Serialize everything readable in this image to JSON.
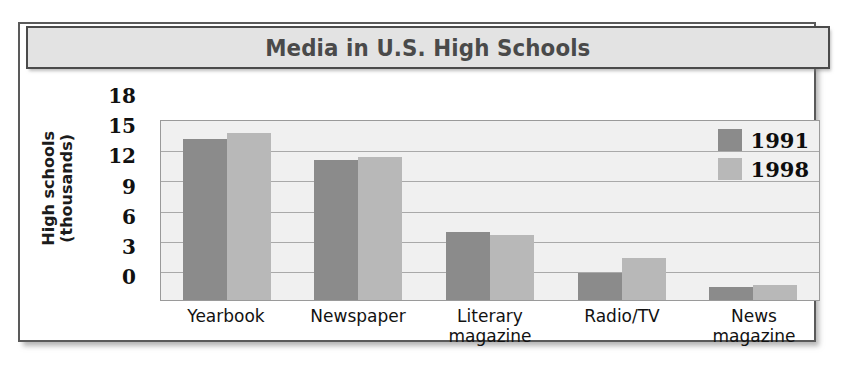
{
  "figure": {
    "title": "Media in U.S. High Schools"
  },
  "axes": {
    "y_title_line1": "High schools",
    "y_title_line2": "(thousands)",
    "y_ticks": [
      "18",
      "15",
      "12",
      "9",
      "6",
      "3",
      "0"
    ]
  },
  "legend": {
    "entries": [
      {
        "label": "1991",
        "color": "#8b8b8b"
      },
      {
        "label": "1998",
        "color": "#b8b8b8"
      }
    ]
  },
  "categories": [
    "Yearbook",
    "Newspaper",
    "Literary\nmagazine",
    "Radio/TV",
    "News\nmagazine"
  ],
  "chart_data": {
    "type": "bar",
    "title": "Media in U.S. High Schools",
    "xlabel": "",
    "ylabel": "High schools (thousands)",
    "ylim": [
      0,
      18
    ],
    "yticks": [
      0,
      3,
      6,
      9,
      12,
      15,
      18
    ],
    "grid": true,
    "legend_position": "top-right",
    "categories": [
      "Yearbook",
      "Newspaper",
      "Literary magazine",
      "Radio/TV",
      "News magazine"
    ],
    "series": [
      {
        "name": "1991",
        "color": "#8b8b8b",
        "values": [
          16.0,
          13.9,
          6.8,
          2.7,
          1.3
        ]
      },
      {
        "name": "1998",
        "color": "#b8b8b8",
        "values": [
          16.6,
          14.2,
          6.5,
          4.2,
          1.5
        ]
      }
    ]
  }
}
